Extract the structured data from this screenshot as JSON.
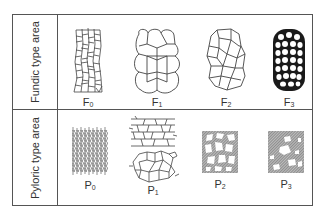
{
  "rows": [
    {
      "label": "Fundic type area",
      "items": [
        {
          "letter": "F",
          "sub": "0",
          "pattern": "elongated-irregular-cells"
        },
        {
          "letter": "F",
          "sub": "1",
          "pattern": "large-rounded-hexagonal-cells"
        },
        {
          "letter": "F",
          "sub": "2",
          "pattern": "polygonal-cells"
        },
        {
          "letter": "F",
          "sub": "3",
          "pattern": "dark-bordered-small-round-cells"
        }
      ]
    },
    {
      "label": "Pyloric type area",
      "items": [
        {
          "letter": "P",
          "sub": "0",
          "pattern": "dense-fine-mesh"
        },
        {
          "letter": "P",
          "sub": "1",
          "pattern": "linear-and-polygonal-cells"
        },
        {
          "letter": "P",
          "sub": "2",
          "pattern": "hatched-network-with-holes"
        },
        {
          "letter": "P",
          "sub": "3",
          "pattern": "hatched-solid-with-sparse-holes"
        }
      ]
    }
  ],
  "colors": {
    "line": "#555555",
    "ink": "#333333",
    "background": "#ffffff"
  }
}
